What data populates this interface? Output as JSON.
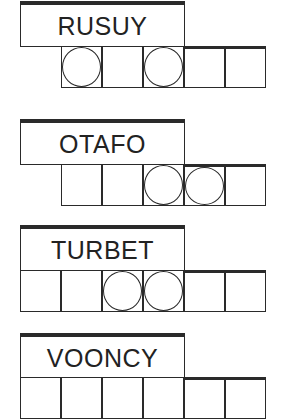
{
  "puzzle": {
    "type": "word-jumble",
    "words": [
      {
        "scrambled": "RUSUY",
        "top": 0,
        "cell_start_x": 61,
        "cells": [
          {
            "circled": true,
            "thick_top": false
          },
          {
            "circled": false,
            "thick_top": false
          },
          {
            "circled": true,
            "thick_top": false
          },
          {
            "circled": false,
            "thick_top": true
          },
          {
            "circled": false,
            "thick_top": true
          }
        ]
      },
      {
        "scrambled": "OTAFO",
        "top": 118,
        "cell_start_x": 61,
        "cells": [
          {
            "circled": false,
            "thick_top": false
          },
          {
            "circled": false,
            "thick_top": false
          },
          {
            "circled": true,
            "thick_top": false
          },
          {
            "circled": true,
            "thick_top": true
          },
          {
            "circled": false,
            "thick_top": true
          }
        ]
      },
      {
        "scrambled": "TURBET",
        "top": 224,
        "cell_start_x": 20,
        "cells": [
          {
            "circled": false,
            "thick_top": false
          },
          {
            "circled": false,
            "thick_top": false
          },
          {
            "circled": true,
            "thick_top": false
          },
          {
            "circled": true,
            "thick_top": false
          },
          {
            "circled": false,
            "thick_top": true
          },
          {
            "circled": false,
            "thick_top": true
          }
        ]
      },
      {
        "scrambled": "VOONCY",
        "top": 332,
        "cell_start_x": 20,
        "cells": [
          {
            "circled": false,
            "thick_top": false
          },
          {
            "circled": false,
            "thick_top": false
          },
          {
            "circled": false,
            "thick_top": false
          },
          {
            "circled": false,
            "thick_top": false
          },
          {
            "circled": false,
            "thick_top": true
          },
          {
            "circled": false,
            "thick_top": true
          }
        ]
      }
    ]
  },
  "colors": {
    "line": "#2a2a2a",
    "text": "#222222",
    "background": "#ffffff"
  }
}
